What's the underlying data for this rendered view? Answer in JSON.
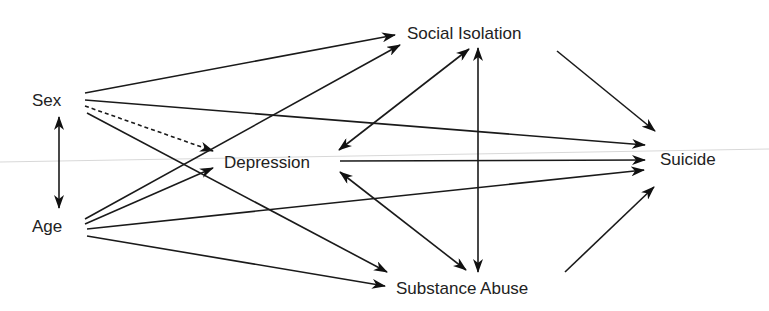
{
  "diagram": {
    "type": "path-model",
    "nodes": [
      {
        "id": "sex",
        "label": "Sex",
        "x": 57,
        "y": 101
      },
      {
        "id": "age",
        "label": "Age",
        "x": 60,
        "y": 227
      },
      {
        "id": "depression",
        "label": "Depression",
        "x": 277,
        "y": 163
      },
      {
        "id": "social_isolation",
        "label": "Social Isolation",
        "x": 477,
        "y": 34
      },
      {
        "id": "substance_abuse",
        "label": "Substance Abuse",
        "x": 478,
        "y": 289
      },
      {
        "id": "suicide",
        "label": "Suicide",
        "x": 688,
        "y": 160
      }
    ],
    "edges": [
      {
        "from": "sex",
        "to": "age",
        "style": "solid",
        "direction": "both"
      },
      {
        "from": "sex",
        "to": "social_isolation",
        "style": "solid",
        "direction": "forward"
      },
      {
        "from": "sex",
        "to": "suicide",
        "style": "solid",
        "direction": "forward"
      },
      {
        "from": "sex",
        "to": "depression",
        "style": "dashed",
        "direction": "forward"
      },
      {
        "from": "sex",
        "to": "substance_abuse",
        "style": "solid",
        "direction": "forward"
      },
      {
        "from": "age",
        "to": "social_isolation",
        "style": "solid",
        "direction": "forward"
      },
      {
        "from": "age",
        "to": "depression",
        "style": "solid",
        "direction": "forward"
      },
      {
        "from": "age",
        "to": "suicide",
        "style": "solid",
        "direction": "forward"
      },
      {
        "from": "age",
        "to": "substance_abuse",
        "style": "solid",
        "direction": "forward"
      },
      {
        "from": "depression",
        "to": "social_isolation",
        "style": "solid",
        "direction": "both"
      },
      {
        "from": "depression",
        "to": "substance_abuse",
        "style": "solid",
        "direction": "both"
      },
      {
        "from": "depression",
        "to": "suicide",
        "style": "solid",
        "direction": "forward"
      },
      {
        "from": "social_isolation",
        "to": "substance_abuse",
        "style": "solid",
        "direction": "both"
      },
      {
        "from": "social_isolation",
        "to": "suicide",
        "style": "solid",
        "direction": "forward"
      },
      {
        "from": "substance_abuse",
        "to": "suicide",
        "style": "solid",
        "direction": "forward"
      }
    ]
  },
  "labels": {
    "sex": "Sex",
    "age": "Age",
    "depression": "Depression",
    "social_isolation": "Social Isolation",
    "substance_abuse": "Substance Abuse",
    "suicide": "Suicide"
  }
}
